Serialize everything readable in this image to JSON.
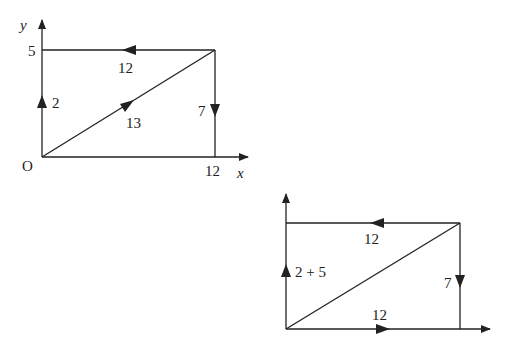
{
  "diagram1": {
    "y_axis_label": "y",
    "x_axis_label": "x",
    "origin_label": "O",
    "y_tick": "5",
    "x_tick": "12",
    "top_edge_label": "12",
    "left_vector_label": "2",
    "diagonal_label": "13",
    "right_edge_label": "7"
  },
  "diagram2": {
    "top_edge_label": "12",
    "left_vector_label": "2 + 5",
    "right_edge_label": "7",
    "bottom_vector_label": "12"
  },
  "colors": {
    "stroke": "#222222",
    "background": "#ffffff"
  }
}
